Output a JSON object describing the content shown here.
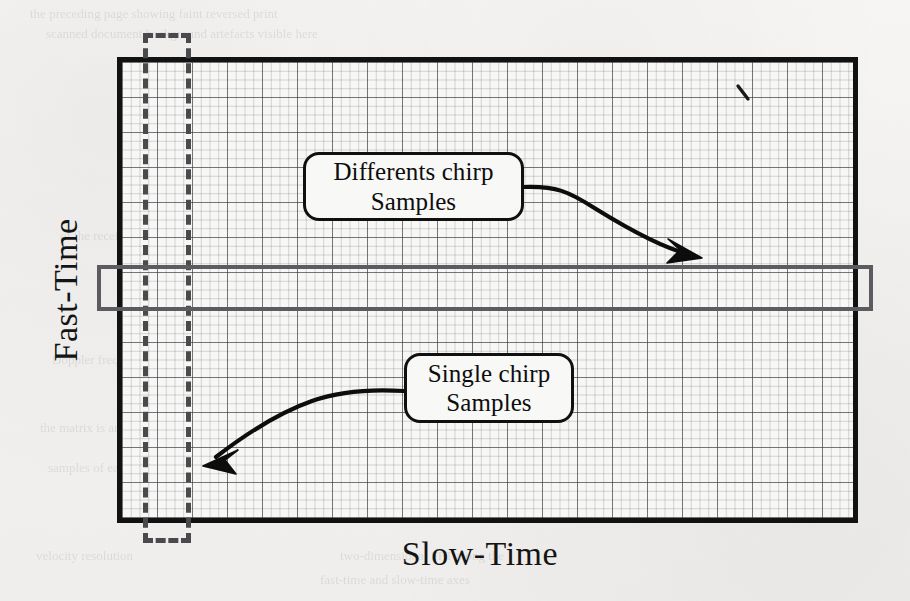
{
  "figure": {
    "kind": "radar-data-matrix-diagram",
    "axes": {
      "y_label": "Fast-Time",
      "x_label": "Slow-Time"
    },
    "matrix": {
      "columns": 21,
      "rows": 13,
      "cell_size_px": 35,
      "border_color": "#121212",
      "grid_color": "#3c3c40",
      "fill_color": "#f7f7f5"
    },
    "selections": [
      {
        "name": "slow-time-column-selection",
        "orientation": "vertical",
        "style": "dashed",
        "color": "#4a4a4d",
        "describes": "Single chirp Samples"
      },
      {
        "name": "fast-time-row-selection",
        "orientation": "horizontal",
        "style": "solid",
        "color": "#5c5c60",
        "describes": "Differents chirp Samples"
      }
    ],
    "callouts": [
      {
        "id": "differents-chirp",
        "line1": "Differents chirp",
        "line2": "Samples",
        "points_to": "fast-time-row-selection"
      },
      {
        "id": "single-chirp",
        "line1": "Single chirp",
        "line2": "Samples",
        "points_to": "slow-time-column-selection"
      }
    ],
    "bleed_through": [
      {
        "text": "the preceding page showing faint reversed print",
        "x": 30,
        "y": 6,
        "size": 13
      },
      {
        "text": "scanned document background artefacts visible here",
        "x": 46,
        "y": 26,
        "size": 13
      },
      {
        "text": "1. Radar Signal Processing",
        "x": 470,
        "y": 118,
        "size": 15
      },
      {
        "text": "with the range profile obtained",
        "x": 505,
        "y": 208,
        "size": 13
      },
      {
        "text": "of the received waveform and",
        "x": 60,
        "y": 228,
        "size": 13
      },
      {
        "text": "estimation accuracy depends",
        "x": 630,
        "y": 250,
        "size": 13
      },
      {
        "text": "target detection across the",
        "x": 640,
        "y": 330,
        "size": 13
      },
      {
        "text": "Doppler frequency shift",
        "x": 52,
        "y": 352,
        "size": 13
      },
      {
        "text": "consecutive chirps in",
        "x": 640,
        "y": 376,
        "size": 13
      },
      {
        "text": "coherent processing interval",
        "x": 600,
        "y": 398,
        "size": 13
      },
      {
        "text": "the matrix is arranged so",
        "x": 40,
        "y": 420,
        "size": 13
      },
      {
        "text": "dimension corresponds to",
        "x": 620,
        "y": 440,
        "size": 13
      },
      {
        "text": "samples of each",
        "x": 48,
        "y": 460,
        "size": 13
      },
      {
        "text": "velocity resolution",
        "x": 36,
        "y": 548,
        "size": 13
      },
      {
        "text": "two-dimensional FFT along the",
        "x": 340,
        "y": 548,
        "size": 13
      },
      {
        "text": "fast-time and slow-time axes",
        "x": 320,
        "y": 572,
        "size": 13
      }
    ],
    "stray_mark": {
      "name": "scan-speck",
      "x": 742,
      "y": 92
    }
  }
}
